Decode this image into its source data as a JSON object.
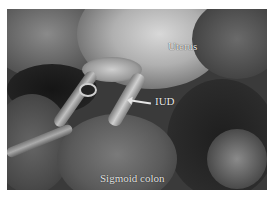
{
  "figure": {
    "type": "grayscale laparoscopic surgical photograph",
    "labels": {
      "uterus": "Uterus",
      "iud": "IUD",
      "sigmoid_colon": "Sigmoid colon"
    },
    "annotations": {
      "iud_arrow": "arrow pointing left toward IUD"
    },
    "colors": {
      "label_text": "#e8e8e8",
      "background_margin": "#ffffff"
    }
  }
}
